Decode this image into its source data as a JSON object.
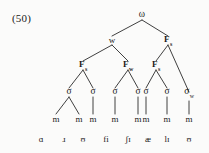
{
  "example": {
    "number": "(50)"
  },
  "colors": {
    "ink": "#1b1b1b",
    "paper": "#fbfbfa",
    "line": "#2a2a2a"
  },
  "tree": {
    "type": "prosodic-structure-tree",
    "root": {
      "label": "ω",
      "name": "prosodic-word"
    },
    "level2": [
      {
        "label": "w",
        "sub": "",
        "name": "weak-branch"
      },
      {
        "label": "F",
        "sub": "s",
        "name": "strong-foot-group"
      }
    ],
    "feet": [
      {
        "label": "F",
        "sub": "s",
        "name": "foot-strong-1"
      },
      {
        "label": "F",
        "sub": "w",
        "name": "foot-weak-1"
      },
      {
        "label": "F",
        "sub": "s",
        "name": "foot-strong-2"
      }
    ],
    "syllables": [
      {
        "label": "σ",
        "sub": "",
        "name": "syllable-1"
      },
      {
        "label": "σ",
        "sub": "",
        "name": "syllable-2"
      },
      {
        "label": "σ",
        "sub": "",
        "name": "syllable-3"
      },
      {
        "label": "σ",
        "sub": "",
        "name": "syllable-4"
      },
      {
        "label": "σ",
        "sub": "",
        "name": "syllable-5"
      },
      {
        "label": "σ",
        "sub": "",
        "name": "syllable-6"
      },
      {
        "label": "σ",
        "sub": "w",
        "name": "syllable-7-weak"
      }
    ],
    "moras": [
      {
        "label": "m",
        "name": "mora-1"
      },
      {
        "label": "m",
        "name": "mora-2"
      },
      {
        "label": "m",
        "name": "mora-3"
      },
      {
        "label": "m",
        "name": "mora-4"
      },
      {
        "label": "m",
        "name": "mora-5"
      },
      {
        "label": "m",
        "name": "mora-6"
      },
      {
        "label": "m",
        "name": "mora-7"
      },
      {
        "label": "m",
        "name": "mora-8"
      },
      {
        "label": "m",
        "name": "mora-9"
      }
    ],
    "segments": [
      {
        "label": "ɑ",
        "name": "segment-1"
      },
      {
        "label": "ɹ",
        "name": "segment-2"
      },
      {
        "label": "ʊ",
        "name": "segment-3"
      },
      {
        "label": "fi",
        "name": "segment-4"
      },
      {
        "label": "ʃɪ",
        "name": "segment-5"
      },
      {
        "label": "æ",
        "name": "segment-6"
      },
      {
        "label": "lɪ",
        "name": "segment-7"
      },
      {
        "label": "ʊ",
        "name": "segment-8"
      }
    ]
  }
}
